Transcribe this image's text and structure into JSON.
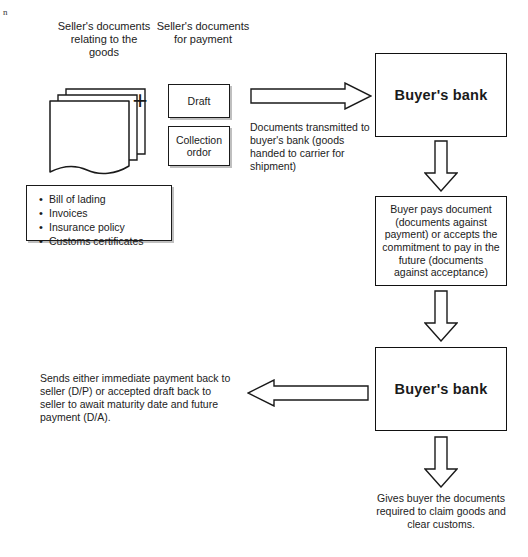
{
  "diagram": {
    "corner_mark": "n",
    "headings": {
      "seller_docs_goods": "Seller's documents relating to the goods",
      "seller_docs_payment": "Seller's documents for payment"
    },
    "plus_symbol": "+",
    "payment_docs": [
      {
        "label": "Draft"
      },
      {
        "label": "Collection ordor"
      }
    ],
    "documents_list": {
      "items": [
        "Bill of lading",
        "Invoices",
        "Insurance policy",
        "Customs certificates"
      ]
    },
    "captions": {
      "transmitted": "Documents transmitted to buyer's bank (goods handed to carrier for shipment)",
      "sends_back": "Sends either immediate payment back to seller (D/P) or accepted draft back to seller to await maturity date and future payment (D/A).",
      "gives_buyer": "Gives buyer the documents required to claim goods and clear customs."
    },
    "nodes": {
      "buyers_bank_top": "Buyer's bank",
      "buyer_pays": "Buyer pays document (documents against payment) or accepts the commitment to pay in the future (documents against acceptance)",
      "buyers_bank_bottom": "Buyer's bank"
    },
    "arrows": [
      {
        "name": "arrow-right-to-bank",
        "direction": "right"
      },
      {
        "name": "arrow-down-bank-to-pays",
        "direction": "down"
      },
      {
        "name": "arrow-down-pays-to-bank",
        "direction": "down"
      },
      {
        "name": "arrow-left-to-seller",
        "direction": "left"
      },
      {
        "name": "arrow-down-bank-to-buyer",
        "direction": "down"
      }
    ],
    "colors": {
      "stroke": "#1a1a1a",
      "fill": "#ffffff",
      "shadow": "#bfbfbf",
      "text": "#222222"
    }
  }
}
